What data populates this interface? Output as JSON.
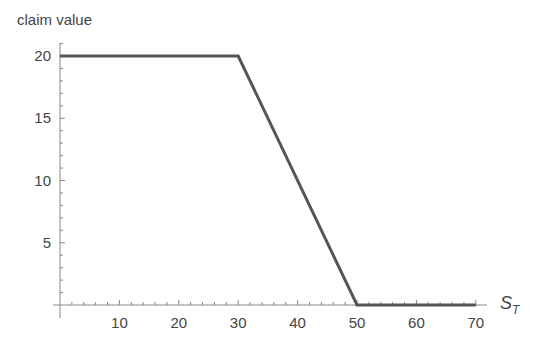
{
  "chart_data": {
    "type": "line",
    "title": "",
    "xlabel": "S",
    "xlabel_subscript": "T",
    "ylabel": "claim value",
    "xlim": [
      0,
      70
    ],
    "ylim": [
      0,
      21
    ],
    "x_ticks": [
      10,
      20,
      30,
      40,
      50,
      60,
      70
    ],
    "y_ticks": [
      5,
      10,
      15,
      20
    ],
    "grid": false,
    "legend": null,
    "series": [
      {
        "name": "claim value",
        "color": "#555555",
        "x": [
          0,
          30,
          50,
          70
        ],
        "y": [
          20,
          20,
          0,
          0
        ]
      }
    ]
  }
}
